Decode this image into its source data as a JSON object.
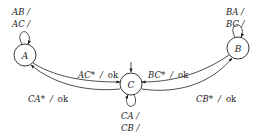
{
  "diagram": {
    "type": "state-machine",
    "nodes": [
      {
        "id": "A",
        "label": "A"
      },
      {
        "id": "B",
        "label": "B"
      },
      {
        "id": "C",
        "label": "C",
        "initial": true
      }
    ],
    "self_loops": {
      "A": {
        "line1": "AB  /",
        "line2": "AC  /"
      },
      "B": {
        "line1": "BA  /",
        "line2": "BC  /"
      },
      "C": {
        "line1": "CA  /",
        "line2": "CB  /"
      }
    },
    "edges": {
      "A_to_C": {
        "from": "A",
        "to": "C",
        "input": "AC*",
        "sep": "/",
        "output": "ok"
      },
      "C_to_A": {
        "from": "C",
        "to": "A",
        "input": "CA*",
        "sep": "/",
        "output": "ok"
      },
      "B_to_C": {
        "from": "B",
        "to": "C",
        "input": "BC*",
        "sep": "/",
        "output": "ok"
      },
      "C_to_B": {
        "from": "C",
        "to": "B",
        "input": "CB*",
        "sep": "/",
        "output": "ok"
      }
    },
    "colors": {
      "stroke": "#222222",
      "background": "#ffffff"
    }
  }
}
